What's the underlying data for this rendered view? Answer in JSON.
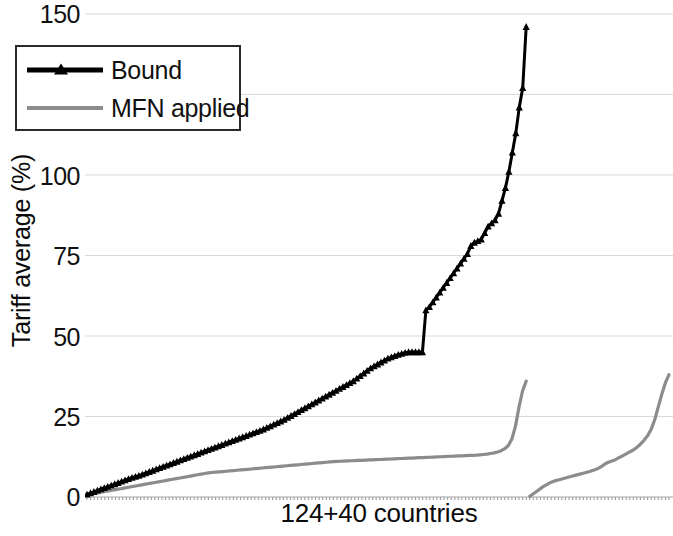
{
  "chart_data": {
    "type": "line",
    "title": "",
    "xlabel": "124+40 countries",
    "ylabel": "Tariff average (%)",
    "ylim": [
      0,
      150
    ],
    "yticks": [
      0,
      25,
      50,
      75,
      100,
      125,
      150
    ],
    "ytick_labels": [
      "0",
      "25",
      "50",
      "75",
      "100",
      "125",
      "150"
    ],
    "xtick_labels": [],
    "grid": "horizontal",
    "legend_position": "top-left-inside",
    "series": [
      {
        "name": "Bound",
        "color": "#000000",
        "marker": "triangle",
        "note": "124 WTO members sorted ascending by bound tariff average; sharp step from ~45 to ~58 near rank 98; steep rise at the top end to a maximum of ~146",
        "values": [
          0.8,
          1.2,
          1.6,
          2.0,
          2.4,
          2.8,
          3.2,
          3.6,
          4.0,
          4.4,
          4.8,
          5.2,
          5.6,
          6.0,
          6.3,
          6.6,
          7.0,
          7.4,
          7.8,
          8.2,
          8.6,
          9.0,
          9.4,
          9.8,
          10.2,
          10.6,
          11.0,
          11.4,
          11.8,
          12.2,
          12.6,
          13.0,
          13.4,
          13.8,
          14.2,
          14.6,
          15.0,
          15.4,
          15.8,
          16.2,
          16.6,
          17.0,
          17.4,
          17.8,
          18.2,
          18.6,
          19.0,
          19.4,
          19.8,
          20.2,
          20.6,
          21.0,
          21.5,
          22.0,
          22.5,
          23.0,
          23.5,
          24.0,
          24.6,
          25.2,
          25.8,
          26.4,
          27.0,
          27.6,
          28.2,
          28.8,
          29.4,
          30.0,
          30.6,
          31.2,
          31.8,
          32.4,
          33.0,
          33.6,
          34.2,
          34.8,
          35.4,
          36.0,
          36.8,
          37.6,
          38.4,
          39.2,
          40.0,
          40.6,
          41.2,
          41.8,
          42.4,
          43.0,
          43.4,
          43.8,
          44.2,
          44.5,
          44.8,
          45.0,
          45.0,
          45.0,
          45.0,
          45.0,
          58.0,
          59.0,
          60.5,
          62.0,
          63.5,
          65.0,
          66.5,
          68.0,
          69.5,
          71.0,
          72.5,
          74.0,
          75.5,
          78.0,
          79.0,
          79.5,
          80.0,
          82.0,
          84.0,
          85.0,
          86.0,
          88.0,
          92.0,
          96.0,
          101.0,
          107.0,
          113.0,
          121.0,
          127.0,
          146.0
        ]
      },
      {
        "name": "MFN applied",
        "color": "#8c8c8c",
        "marker": "none",
        "note": "Two separate runs: the first 124 countries rise gently from ~1 to ~12 then spike to ~36; a second run of 40 countries restarts near 0 and rises to ~38 at the right edge",
        "segments": [
          {
            "values": [
              0.6,
              0.9,
              1.1,
              1.3,
              1.5,
              1.7,
              1.9,
              2.1,
              2.3,
              2.5,
              2.7,
              2.9,
              3.1,
              3.3,
              3.5,
              3.7,
              3.9,
              4.1,
              4.3,
              4.5,
              4.7,
              4.9,
              5.1,
              5.3,
              5.5,
              5.7,
              5.9,
              6.1,
              6.3,
              6.5,
              6.7,
              6.9,
              7.1,
              7.3,
              7.5,
              7.6,
              7.7,
              7.8,
              7.9,
              8.0,
              8.1,
              8.2,
              8.3,
              8.4,
              8.5,
              8.6,
              8.7,
              8.8,
              8.9,
              9.0,
              9.1,
              9.2,
              9.3,
              9.4,
              9.5,
              9.6,
              9.7,
              9.8,
              9.9,
              10.0,
              10.1,
              10.2,
              10.3,
              10.4,
              10.5,
              10.6,
              10.7,
              10.8,
              10.9,
              11.0,
              11.05,
              11.1,
              11.15,
              11.2,
              11.25,
              11.3,
              11.35,
              11.4,
              11.45,
              11.5,
              11.55,
              11.6,
              11.65,
              11.7,
              11.75,
              11.8,
              11.85,
              11.9,
              11.95,
              12.0,
              12.05,
              12.1,
              12.15,
              12.2,
              12.25,
              12.3,
              12.35,
              12.4,
              12.45,
              12.5,
              12.55,
              12.6,
              12.65,
              12.7,
              12.75,
              12.8,
              12.85,
              12.9,
              12.95,
              13.0,
              13.1,
              13.2,
              13.3,
              13.5,
              13.7,
              14.0,
              14.4,
              15.0,
              16.0,
              18.0,
              22.0,
              28.0,
              33.0,
              36.0
            ]
          },
          {
            "values": [
              0.2,
              1.0,
              1.8,
              2.6,
              3.4,
              4.0,
              4.6,
              5.0,
              5.3,
              5.6,
              5.9,
              6.2,
              6.5,
              6.8,
              7.1,
              7.4,
              7.7,
              8.0,
              8.4,
              8.8,
              9.4,
              10.2,
              10.8,
              11.2,
              11.6,
              12.2,
              12.8,
              13.4,
              14.0,
              14.6,
              15.4,
              16.4,
              17.6,
              19.0,
              21.0,
              24.0,
              28.0,
              32.0,
              35.5,
              38.0
            ]
          }
        ]
      }
    ]
  },
  "axis": {
    "y_title": "Tariff average (%)",
    "x_title": "124+40 countries",
    "y_tick_150": "150",
    "y_tick_125": "125",
    "y_tick_100": "100",
    "y_tick_75": "75",
    "y_tick_50": "50",
    "y_tick_25": "25",
    "y_tick_0": "0"
  },
  "legend": {
    "bound_label": "Bound",
    "mfn_label": "MFN applied"
  },
  "colors": {
    "bound": "#000000",
    "mfn": "#8c8c8c",
    "grid": "#d9d9d9",
    "text": "#111111"
  }
}
